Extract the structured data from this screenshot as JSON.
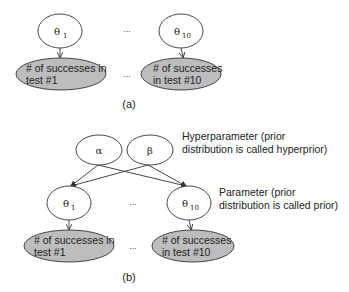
{
  "panel_a": {
    "caption": "(a)",
    "theta_1": {
      "symbol": "θ",
      "subscript": "1"
    },
    "theta_10": {
      "symbol": "θ",
      "subscript": "10"
    },
    "ellipsis_params": "...",
    "ellipsis_obs": "...",
    "obs_1": {
      "line1": "# of successes in",
      "line2": "test #1"
    },
    "obs_10": {
      "line1": "# of successes",
      "line2": "in test #10"
    }
  },
  "panel_b": {
    "caption": "(b)",
    "alpha": "α",
    "beta": "β",
    "theta_1": {
      "symbol": "θ",
      "subscript": "1"
    },
    "theta_10": {
      "symbol": "θ",
      "subscript": "10"
    },
    "ellipsis_params": "...",
    "ellipsis_obs": "...",
    "obs_1": {
      "line1": "# of successes in",
      "line2": "test #1"
    },
    "obs_10": {
      "line1": "# of successes",
      "line2": "in test #10"
    },
    "hyper_note": {
      "line1": "Hyperparameter (prior",
      "line2": "distribution is called hyperprior)"
    },
    "param_note": {
      "line1": "Parameter (prior",
      "line2": "distribution is called prior)"
    }
  },
  "colors": {
    "observed_fill": "#bdbdbd",
    "stroke": "#333333",
    "background": "#ffffff"
  }
}
